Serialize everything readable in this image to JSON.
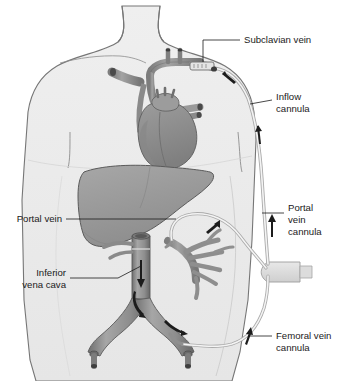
{
  "labels": {
    "subclavian_vein": "Subclavian vein",
    "inflow_cannula_line1": "Inflow",
    "inflow_cannula_line2": "cannula",
    "portal_vein_cannula_line1": "Portal",
    "portal_vein_cannula_line2": "vein",
    "portal_vein_cannula_line3": "cannula",
    "femoral_vein_cannula_line1": "Femoral vein",
    "femoral_vein_cannula_line2": "cannula",
    "portal_vein": "Portal vein",
    "inferior_vena_cava_line1": "Inferior",
    "inferior_vena_cava_line2": "vena cava"
  },
  "anatomy": {
    "body_outline": "torso",
    "heart": "heart",
    "liver": "liver",
    "portal_vein": "portal vein",
    "inferior_vena_cava": "inferior vena cava",
    "iliac_veins": "iliac veins",
    "aortic_arch": "aortic arch"
  },
  "devices": {
    "inflow_cannula": "inflow cannula tubing",
    "portal_vein_cannula": "portal vein cannula tubing",
    "femoral_vein_cannula": "femoral vein cannula tubing",
    "pump_connector": "pump connector block",
    "subclavian_hub": "subclavian insertion hub"
  },
  "flow_arrows": {
    "subclavian_inflow": "flow toward subclavian vein",
    "inflow_upward": "upward flow in inflow cannula",
    "portal_upward": "upward flow in portal vein cannula",
    "portal_draw": "flow out of portal vein",
    "ivc_downward": "downward flow in inferior vena cava",
    "iliac_flow": "flow into iliac vein",
    "femoral_upward": "upward flow in femoral cannula",
    "ivc_bifurcation": "flow at bifurcation"
  },
  "colors": {
    "body_fill": "#ececec",
    "body_stroke": "#6f6f6f",
    "organ_fill": "#9b9b9b",
    "organ_stroke": "#5a5a5a",
    "vessel_fill": "#8e8e8e",
    "vessel_dark": "#6a6a6a",
    "heart_fill": "#8f8f8f",
    "tube_stroke": "#9a9a9a",
    "label_text": "#1a1a1a",
    "background": "#ffffff"
  }
}
